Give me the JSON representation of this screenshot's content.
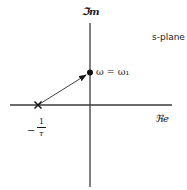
{
  "diagram": {
    "title": "s-plane",
    "axes": {
      "imaginary_label": "ℑm",
      "real_label": "ℜe"
    },
    "pole": {
      "marker": "x-marker",
      "label_sign": "−",
      "label_numerator": "1",
      "label_denominator": "τ",
      "label_full": "−1/τ"
    },
    "point": {
      "marker": "filled-dot",
      "label": "ω = ω₁"
    },
    "arrow": {
      "from": "pole",
      "to": "point"
    },
    "colors": {
      "line": "#1a1a1a",
      "background": "#ffffff"
    }
  }
}
